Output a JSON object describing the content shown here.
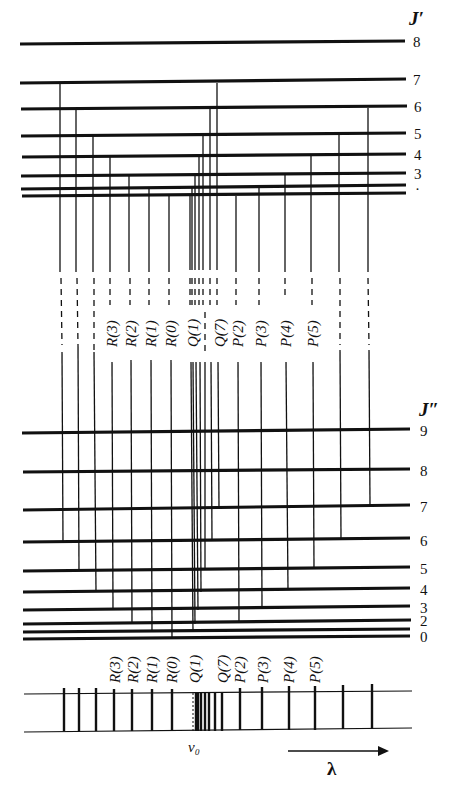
{
  "diagram": {
    "type": "energy-level-diagram",
    "upper_state": {
      "label": "J′",
      "levels": [
        {
          "J": "8",
          "y": 42
        },
        {
          "J": "7",
          "y": 82
        },
        {
          "J": "6",
          "y": 108
        },
        {
          "J": "5",
          "y": 135
        },
        {
          "J": "4",
          "y": 156
        },
        {
          "J": "3",
          "y": 175
        },
        {
          "J": "·",
          "y": 186
        },
        {
          "J": "",
          "y": 194
        }
      ]
    },
    "lower_state": {
      "label": "J″",
      "levels": [
        {
          "J": "9",
          "y": 430
        },
        {
          "J": "8",
          "y": 471
        },
        {
          "J": "7",
          "y": 508
        },
        {
          "J": "6",
          "y": 541
        },
        {
          "J": "5",
          "y": 569
        },
        {
          "J": "4",
          "y": 590
        },
        {
          "J": "3",
          "y": 608
        },
        {
          "J": "2",
          "y": 622
        },
        {
          "J": "",
          "y": 630
        },
        {
          "J": "0",
          "y": 636
        }
      ]
    },
    "branch_labels": [
      "R(3)",
      "R(2)",
      "R(1)",
      "R(0)",
      "Q(1)",
      "Q(7)",
      "P(2)",
      "P(3)",
      "P(4)",
      "P(5)"
    ],
    "spectrum": {
      "origin_label": "ν₀",
      "wavelength_label": "λ",
      "arrow_direction": "increasing wavelength to the right"
    }
  }
}
